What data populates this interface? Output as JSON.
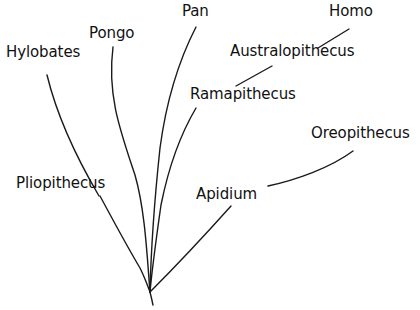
{
  "figure": {
    "type": "phylogenetic-tree",
    "title": "",
    "background_color": "#ffffff",
    "line_color": "#1a1a1a",
    "text_color": "#111111",
    "width": 420,
    "height": 310,
    "root": {
      "x": 150,
      "y": 292
    }
  },
  "taxa": [
    {
      "id": "hylobates",
      "label": "Hylobates",
      "label_x": 6,
      "label_y": 45,
      "kind": "leader",
      "branch": "M47,75 C56,112 72,150 99,196"
    },
    {
      "id": "pongo",
      "label": "Pongo",
      "label_x": 89,
      "label_y": 26,
      "kind": "branch",
      "branch": "M113,47 C107,95 120,130 135,175 C145,210 147,255 150,292"
    },
    {
      "id": "pan",
      "label": "Pan",
      "label_x": 182,
      "label_y": 4,
      "kind": "branch",
      "branch": "M196,27 C178,62 166,103 160,148 C155,195 151,250 150,292"
    },
    {
      "id": "homo",
      "label": "Homo",
      "label_x": 329,
      "label_y": 4,
      "kind": "leader",
      "branch": "M318,48 L349,29"
    },
    {
      "id": "australopithecus",
      "label": "Australopithecus",
      "label_x": 230,
      "label_y": 44,
      "kind": "leader",
      "branch": "M236,86 L272,66"
    },
    {
      "id": "ramapithecus",
      "label": "Ramapithecus",
      "label_x": 190,
      "label_y": 87,
      "kind": "branch",
      "branch": "M196,108 C180,135 168,170 161,205 C156,240 152,270 150,292"
    },
    {
      "id": "oreopithecus",
      "label": "Oreopithecus",
      "label_x": 311,
      "label_y": 126,
      "kind": "leader",
      "branch": "M268,186 C296,180 330,168 353,151"
    },
    {
      "id": "pliopithecus",
      "label": "Pliopithecus",
      "label_x": 16,
      "label_y": 176,
      "kind": "branch",
      "branch": "M100,196 C114,222 128,248 140,268 C145,278 148,287 150,292"
    },
    {
      "id": "apidium",
      "label": "Apidium",
      "label_x": 196,
      "label_y": 187,
      "kind": "branch",
      "branch": "M231,206 C205,235 172,270 150,292"
    }
  ],
  "stem": {
    "id": "root-stem",
    "path": "M150,292 C151,296 152,300 153,305"
  }
}
